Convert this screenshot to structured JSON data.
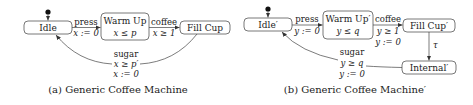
{
  "diagrams": [
    {
      "caption": "(a) Generic Coffee Machine",
      "states": {
        "idle": {
          "name": "Idle"
        },
        "warm_up": {
          "name": "Warm Up",
          "invariant": "x ≤ p"
        },
        "fill_cup": {
          "name": "Fill Cup"
        }
      },
      "transitions": {
        "press": {
          "action": "press",
          "update": "x := 0"
        },
        "coffee": {
          "action": "coffee",
          "guard": "x ≥ 1"
        },
        "sugar": {
          "action": "sugar",
          "guard": "x ≥ p′",
          "update": "x := 0"
        }
      }
    },
    {
      "caption": "(b) Generic Coffee Machine′",
      "states": {
        "idle": {
          "name": "Idle′"
        },
        "warm_up": {
          "name": "Warm Up′",
          "invariant": "y ≤ q"
        },
        "fill_cup": {
          "name": "Fill Cup′"
        },
        "internal": {
          "name": "Internal′"
        }
      },
      "transitions": {
        "press": {
          "action": "press",
          "update": "y := 0"
        },
        "coffee": {
          "action": "coffee",
          "guard": "y ≥ 1",
          "update": "y := 0"
        },
        "tau": {
          "action": "τ"
        },
        "sugar": {
          "action": "sugar",
          "guard": "y ≥ q",
          "update": "y := 0"
        }
      }
    }
  ]
}
